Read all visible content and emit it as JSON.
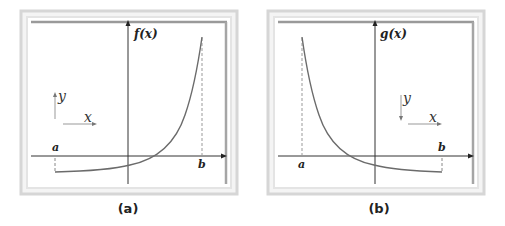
{
  "figure": {
    "panels": [
      {
        "id": "a",
        "caption": "(a)",
        "function_label": "f(x)",
        "bound_left_label": "a",
        "bound_right_label": "b",
        "legend_y_label": "y",
        "legend_x_label": "x",
        "legend_y_direction": "up",
        "curve_description": "increasing exponential, negative near a, crosses x-axis right of y-axis, rises steeply to b"
      },
      {
        "id": "b",
        "caption": "(b)",
        "function_label": "g(x)",
        "bound_left_label": "a",
        "bound_right_label": "b",
        "legend_y_label": "y",
        "legend_x_label": "x",
        "legend_y_direction": "down",
        "curve_description": "decreasing exponential, high at a, crosses x-axis left of y-axis, flattens below axis toward b"
      }
    ],
    "colors": {
      "frame_outer": "#d9d9d9",
      "frame_inner_line": "#9a9a9a",
      "axis": "#333333",
      "curve": "#6b6b6b",
      "dashed": "#888888",
      "legend_arrow": "#8a8a8a"
    }
  }
}
